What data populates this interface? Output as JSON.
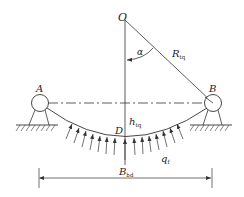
{
  "diagram": {
    "type": "structural-mechanics",
    "labels": {
      "center": "O",
      "angle": "α",
      "radius_main": "R",
      "radius_sub": "tq",
      "support_left": "A",
      "support_right": "B",
      "lowest_point": "D",
      "sag_main": "h",
      "sag_sub": "tq",
      "load_main": "q",
      "load_sub": "f",
      "span_main": "B",
      "span_sub": "bd"
    },
    "colors": {
      "line": "#333333",
      "background": "#ffffff"
    }
  }
}
